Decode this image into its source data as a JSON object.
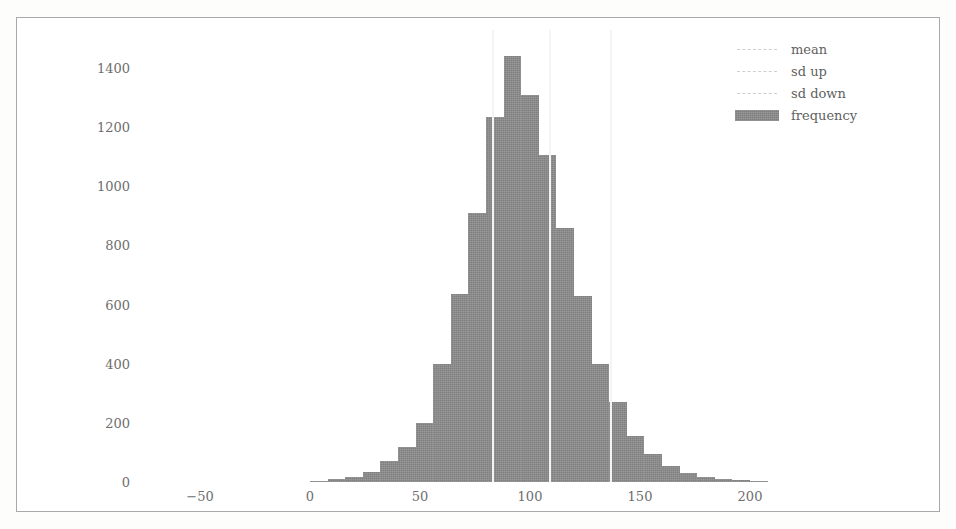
{
  "chart_data": {
    "type": "bar",
    "title": "",
    "subtitle": "",
    "xlabel": "",
    "ylabel": "",
    "grid": false,
    "legend_position": "top-right",
    "xlim": [
      -65,
      235
    ],
    "ylim": [
      0,
      1470
    ],
    "xticks": [
      -50,
      0,
      50,
      100,
      150,
      200
    ],
    "xticklabels": [
      "−50",
      "0",
      "50",
      "100",
      "150",
      "200"
    ],
    "yticks": [
      0,
      200,
      400,
      600,
      800,
      1000,
      1200,
      1400
    ],
    "yticklabels": [
      "0",
      "200",
      "400",
      "600",
      "800",
      "1000",
      "1200",
      "1400"
    ],
    "bin_width": 8,
    "bin_centers": [
      4,
      12,
      20,
      28,
      36,
      44,
      52,
      60,
      68,
      76,
      84,
      92,
      100,
      108,
      116,
      124,
      132,
      140,
      148,
      156,
      164,
      172,
      180,
      188,
      196,
      204
    ],
    "series": [
      {
        "name": "frequency",
        "color": "#8b8b8b",
        "values": [
          4,
          10,
          18,
          35,
          70,
          120,
          200,
          400,
          635,
          910,
          1235,
          1440,
          1310,
          1105,
          860,
          630,
          400,
          270,
          155,
          95,
          55,
          30,
          18,
          10,
          6,
          3
        ]
      }
    ],
    "vlines": [
      {
        "name": "mean",
        "value": 109,
        "color": "#f4f4f4",
        "style": "dashed"
      },
      {
        "name": "sd up",
        "value": 137,
        "color": "#f4f4f4",
        "style": "dashed"
      },
      {
        "name": "sd down",
        "value": 83,
        "color": "#f4f4f4",
        "style": "dashed"
      }
    ],
    "legend": [
      {
        "label": "mean",
        "marker": "line"
      },
      {
        "label": "sd up",
        "marker": "line"
      },
      {
        "label": "sd down",
        "marker": "line"
      },
      {
        "label": "frequency",
        "marker": "patch"
      }
    ]
  }
}
